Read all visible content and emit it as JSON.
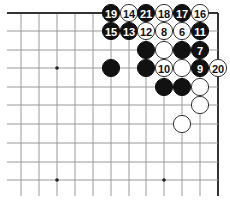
{
  "diagram": {
    "type": "go-board-corner",
    "grid": {
      "columns_x": [
        21,
        39,
        57,
        75,
        93,
        111,
        129,
        146,
        164,
        182,
        200,
        218
      ],
      "rows_y": [
        13,
        31,
        50,
        68,
        87,
        105,
        124,
        143,
        162,
        180
      ],
      "top_edge": true,
      "right_edge": true,
      "left_extent": 7,
      "bottom_extent": 196
    },
    "star_points": [
      {
        "col": 2,
        "row": 3
      },
      {
        "col": 2,
        "row": 9
      },
      {
        "col": 8,
        "row": 9
      }
    ],
    "stones": [
      {
        "color": "black",
        "col": 5,
        "row": 0,
        "label": "19"
      },
      {
        "color": "white",
        "col": 6,
        "row": 0,
        "label": "14"
      },
      {
        "color": "black",
        "col": 7,
        "row": 0,
        "label": "21"
      },
      {
        "color": "white",
        "col": 8,
        "row": 0,
        "label": "18"
      },
      {
        "color": "black",
        "col": 9,
        "row": 0,
        "label": "17"
      },
      {
        "color": "white",
        "col": 10,
        "row": 0,
        "label": "16"
      },
      {
        "color": "black",
        "col": 5,
        "row": 1,
        "label": "15"
      },
      {
        "color": "black",
        "col": 6,
        "row": 1,
        "label": "13"
      },
      {
        "color": "white",
        "col": 7,
        "row": 1,
        "label": "12"
      },
      {
        "color": "white",
        "col": 8,
        "row": 1,
        "label": "8"
      },
      {
        "color": "white",
        "col": 9,
        "row": 1,
        "label": "6"
      },
      {
        "color": "black",
        "col": 10,
        "row": 1,
        "label": "11"
      },
      {
        "color": "black",
        "col": 7,
        "row": 2,
        "label": ""
      },
      {
        "color": "white",
        "col": 8,
        "row": 2,
        "label": ""
      },
      {
        "color": "black",
        "col": 9,
        "row": 2,
        "label": ""
      },
      {
        "color": "black",
        "col": 10,
        "row": 2,
        "label": "7"
      },
      {
        "color": "black",
        "col": 5,
        "row": 3,
        "label": ""
      },
      {
        "color": "black",
        "col": 7,
        "row": 3,
        "label": ""
      },
      {
        "color": "white",
        "col": 8,
        "row": 3,
        "label": "10"
      },
      {
        "color": "white",
        "col": 9,
        "row": 3,
        "label": ""
      },
      {
        "color": "black",
        "col": 10,
        "row": 3,
        "label": "9"
      },
      {
        "color": "white",
        "col": 11,
        "row": 3,
        "label": "20"
      },
      {
        "color": "black",
        "col": 8,
        "row": 4,
        "label": ""
      },
      {
        "color": "black",
        "col": 9,
        "row": 4,
        "label": ""
      },
      {
        "color": "white",
        "col": 10,
        "row": 4,
        "label": ""
      },
      {
        "color": "white",
        "col": 10,
        "row": 5,
        "label": ""
      },
      {
        "color": "white",
        "col": 9,
        "row": 6,
        "label": ""
      }
    ],
    "colors": {
      "black_stone": "#111111",
      "white_stone": "#ffffff",
      "grid": "#9a9a9a",
      "edge": "#333333"
    }
  }
}
